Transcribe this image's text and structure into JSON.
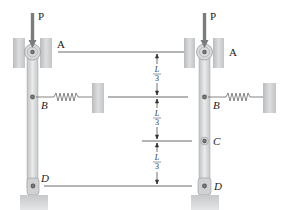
{
  "figure": {
    "left_system": {
      "load_label": "P",
      "points": [
        {
          "id": "A",
          "label": "A",
          "italic": false
        },
        {
          "id": "B",
          "label": "B",
          "italic": true
        },
        {
          "id": "D",
          "label": "D",
          "italic": true
        }
      ]
    },
    "right_system": {
      "load_label": "P",
      "points": [
        {
          "id": "A",
          "label": "A",
          "italic": false
        },
        {
          "id": "B",
          "label": "B",
          "italic": true
        },
        {
          "id": "C",
          "label": "C",
          "italic": true
        },
        {
          "id": "D",
          "label": "D",
          "italic": true
        }
      ]
    },
    "dimensions": [
      {
        "numerator": "L",
        "denominator": "3"
      },
      {
        "numerator": "L",
        "denominator": "3"
      },
      {
        "numerator": "L",
        "denominator": "3"
      }
    ],
    "colors": {
      "bar": "#d4d6d8",
      "wall": "#c9cbcd",
      "line": "#444444",
      "arrow": "#7a7c7e"
    }
  }
}
